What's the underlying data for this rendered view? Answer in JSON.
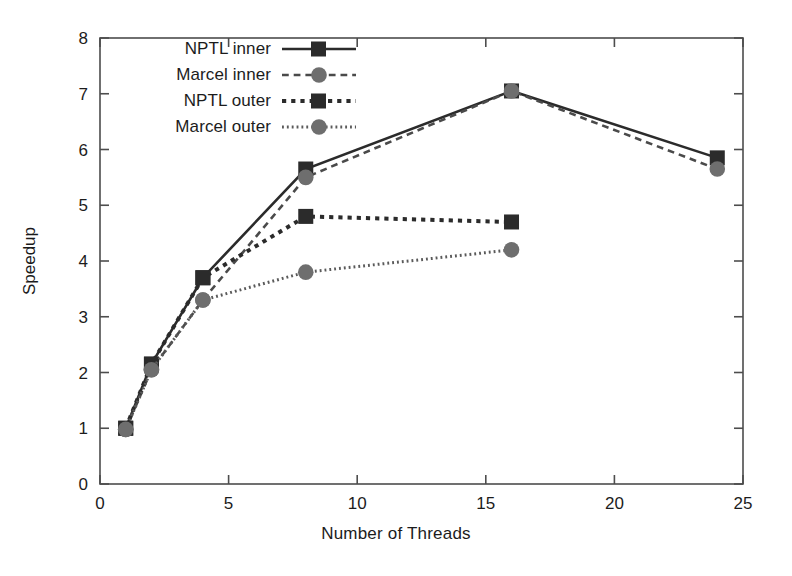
{
  "chart_data": {
    "type": "line",
    "title": "",
    "xlabel": "Number of Threads",
    "ylabel": "Speedup",
    "xlim": [
      0,
      25
    ],
    "ylim": [
      0,
      8
    ],
    "xticks": [
      0,
      5,
      10,
      15,
      20,
      25
    ],
    "yticks": [
      0,
      1,
      2,
      3,
      4,
      5,
      6,
      7,
      8
    ],
    "grid": false,
    "legend_position": "top-left",
    "series": [
      {
        "name": "NPTL inner",
        "marker": "square",
        "marker_color": "#2b2b2b",
        "line_color": "#2b2b2b",
        "line_style": "solid",
        "x": [
          1,
          2,
          4,
          8,
          16,
          24
        ],
        "values": [
          1.0,
          2.15,
          3.7,
          5.65,
          7.05,
          5.85
        ]
      },
      {
        "name": "Marcel inner",
        "marker": "circle",
        "marker_color": "#6e6e6e",
        "line_color": "#4a4a4a",
        "line_style": "dashed",
        "x": [
          1,
          2,
          4,
          8,
          16,
          24
        ],
        "values": [
          0.98,
          2.05,
          3.3,
          5.5,
          7.05,
          5.65
        ]
      },
      {
        "name": "NPTL outer",
        "marker": "square",
        "marker_color": "#2b2b2b",
        "line_color": "#2b2b2b",
        "line_style": "dotted",
        "x": [
          1,
          2,
          4,
          8,
          16
        ],
        "values": [
          1.0,
          2.15,
          3.7,
          4.8,
          4.7
        ]
      },
      {
        "name": "Marcel outer",
        "marker": "circle",
        "marker_color": "#6e6e6e",
        "line_color": "#5a5a5a",
        "line_style": "fine-dotted",
        "x": [
          1,
          2,
          4,
          8,
          16
        ],
        "values": [
          0.98,
          2.05,
          3.3,
          3.8,
          4.2
        ]
      }
    ]
  },
  "legend": {
    "items": [
      {
        "label": "NPTL inner"
      },
      {
        "label": "Marcel inner"
      },
      {
        "label": "NPTL outer"
      },
      {
        "label": "Marcel outer"
      }
    ]
  },
  "axes": {
    "x_tick_labels": [
      "0",
      "5",
      "10",
      "15",
      "20",
      "25"
    ],
    "y_tick_labels": [
      "0",
      "1",
      "2",
      "3",
      "4",
      "5",
      "6",
      "7",
      "8"
    ],
    "xlabel": "Number of Threads",
    "ylabel": "Speedup",
    "frame_color": "#4d4d4d"
  }
}
